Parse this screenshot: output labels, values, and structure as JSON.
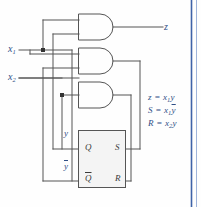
{
  "figure": {
    "type": "logic-circuit-diagram",
    "wire_color": "#555555",
    "label_color": "#2f4f86",
    "pin_color": "#3a3a3a",
    "border_color": "#4a6fb5",
    "background": "#fefefe"
  },
  "inputs": [
    {
      "name": "x1",
      "base": "x",
      "sub": "1",
      "y": 50
    },
    {
      "name": "x2",
      "base": "x",
      "sub": "2",
      "y": 78
    }
  ],
  "outputs": [
    {
      "name": "z",
      "label": "z",
      "y": 27
    }
  ],
  "gates": [
    {
      "id": "and-z",
      "type": "AND",
      "output": "z"
    },
    {
      "id": "and-s",
      "type": "AND",
      "output": "S"
    },
    {
      "id": "and-r",
      "type": "AND",
      "output": "R"
    }
  ],
  "latch": {
    "name": "sr-latch",
    "pins": {
      "q": "Q",
      "s": "S",
      "qbar": "Q",
      "qbar_overline": true,
      "r": "R"
    }
  },
  "feedback_labels": [
    {
      "name": "y",
      "text": "y",
      "overline": false
    },
    {
      "name": "ybar",
      "text": "y",
      "overline": true
    }
  ],
  "equations": [
    {
      "name": "equation-z",
      "lhs": "z",
      "rhs_base": "x",
      "rhs_sub": "1",
      "rhs_tail": "y",
      "tail_overline": false
    },
    {
      "name": "equation-s",
      "lhs": "S",
      "rhs_base": "x",
      "rhs_sub": "1",
      "rhs_tail": "y",
      "tail_overline": true
    },
    {
      "name": "equation-r",
      "lhs": "R",
      "rhs_base": "x",
      "rhs_sub": "2",
      "rhs_tail": "y",
      "tail_overline": false
    }
  ]
}
